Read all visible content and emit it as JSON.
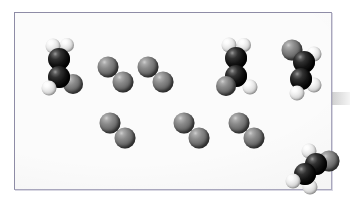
{
  "figure": {
    "panel": {
      "background_color": "#fbfbfb",
      "border_color": "#8e8ca6"
    },
    "edge_mark": {
      "name": "page-edge-smudge",
      "color": "#aaaaaa"
    }
  },
  "legend": {
    "atom_types": [
      {
        "key": "carbon",
        "label": "Carbon",
        "color": "#111111",
        "radius": 11
      },
      {
        "key": "halogen",
        "label": "Halogen",
        "color": "#7a7a7a",
        "radius": 10
      },
      {
        "key": "hydrogen",
        "label": "Hydrogen",
        "color": "#f2f2f2",
        "radius": 7.5
      }
    ]
  },
  "molecules": [
    {
      "name": "alkene-left",
      "formula": "C2H3X",
      "label": "substituted ethene",
      "x": 46,
      "y": 55,
      "atoms": [
        {
          "element": "hydrogen",
          "dx": -8,
          "dy": -22,
          "r": 7.5,
          "z": 3
        },
        {
          "element": "hydrogen",
          "dx": 6,
          "dy": -23,
          "r": 7.0,
          "z": 2
        },
        {
          "element": "carbon",
          "dx": -2,
          "dy": -9,
          "r": 11,
          "z": 5
        },
        {
          "element": "carbon",
          "dx": -2,
          "dy": 9,
          "r": 11,
          "z": 6
        },
        {
          "element": "halogen",
          "dx": 12,
          "dy": 16,
          "r": 10,
          "z": 4
        },
        {
          "element": "hydrogen",
          "dx": -12,
          "dy": 20,
          "r": 7.5,
          "z": 7
        }
      ]
    },
    {
      "name": "diatomic-top-1",
      "formula": "X2",
      "label": "diatomic molecule",
      "x": 101,
      "y": 62,
      "atoms": [
        {
          "element": "halogen",
          "dx": -8,
          "dy": -8,
          "r": 10.5,
          "z": 2
        },
        {
          "element": "halogen",
          "dx": 7,
          "dy": 7,
          "r": 10.5,
          "z": 1
        }
      ]
    },
    {
      "name": "diatomic-top-2",
      "formula": "X2",
      "label": "diatomic molecule",
      "x": 141,
      "y": 62,
      "atoms": [
        {
          "element": "halogen",
          "dx": -8,
          "dy": -8,
          "r": 10.5,
          "z": 2
        },
        {
          "element": "halogen",
          "dx": 7,
          "dy": 7,
          "r": 10.5,
          "z": 1
        }
      ]
    },
    {
      "name": "alkene-center-right",
      "formula": "C2H3X",
      "label": "substituted ethene",
      "x": 222,
      "y": 55,
      "atoms": [
        {
          "element": "hydrogen",
          "dx": -8,
          "dy": -23,
          "r": 7.5,
          "z": 3
        },
        {
          "element": "hydrogen",
          "dx": 7,
          "dy": -23,
          "r": 7.0,
          "z": 2
        },
        {
          "element": "carbon",
          "dx": -1,
          "dy": -10,
          "r": 11,
          "z": 5
        },
        {
          "element": "carbon",
          "dx": -1,
          "dy": 8,
          "r": 11,
          "z": 6
        },
        {
          "element": "halogen",
          "dx": -11,
          "dy": 18,
          "r": 10,
          "z": 7
        },
        {
          "element": "hydrogen",
          "dx": 13,
          "dy": 19,
          "r": 7.5,
          "z": 4
        }
      ]
    },
    {
      "name": "alkene-right",
      "formula": "C2H3X",
      "label": "substituted ethene",
      "x": 288,
      "y": 56,
      "atoms": [
        {
          "element": "halogen",
          "dx": -11,
          "dy": -19,
          "r": 10.5,
          "z": 4
        },
        {
          "element": "hydrogen",
          "dx": 11,
          "dy": -15,
          "r": 7.5,
          "z": 3
        },
        {
          "element": "carbon",
          "dx": 1,
          "dy": -7,
          "r": 11,
          "z": 5
        },
        {
          "element": "carbon",
          "dx": -2,
          "dy": 10,
          "r": 11,
          "z": 6
        },
        {
          "element": "hydrogen",
          "dx": 11,
          "dy": 16,
          "r": 7.5,
          "z": 4
        },
        {
          "element": "hydrogen",
          "dx": -6,
          "dy": 24,
          "r": 7.5,
          "z": 7
        }
      ]
    },
    {
      "name": "diatomic-bottom-1",
      "formula": "X2",
      "label": "diatomic molecule",
      "x": 103,
      "y": 118,
      "atoms": [
        {
          "element": "halogen",
          "dx": -8,
          "dy": -8,
          "r": 10.5,
          "z": 2
        },
        {
          "element": "halogen",
          "dx": 7,
          "dy": 7,
          "r": 10.5,
          "z": 1
        }
      ]
    },
    {
      "name": "diatomic-bottom-2",
      "formula": "X2",
      "label": "diatomic molecule",
      "x": 177,
      "y": 118,
      "atoms": [
        {
          "element": "halogen",
          "dx": -8,
          "dy": -8,
          "r": 10.5,
          "z": 2
        },
        {
          "element": "halogen",
          "dx": 7,
          "dy": 7,
          "r": 10.5,
          "z": 1
        }
      ]
    },
    {
      "name": "diatomic-bottom-3",
      "formula": "X2",
      "label": "diatomic molecule",
      "x": 232,
      "y": 118,
      "atoms": [
        {
          "element": "halogen",
          "dx": -8,
          "dy": -8,
          "r": 10.5,
          "z": 2
        },
        {
          "element": "halogen",
          "dx": 7,
          "dy": 7,
          "r": 10.5,
          "z": 1
        }
      ]
    },
    {
      "name": "alkene-bottom-right",
      "formula": "C2H3X",
      "label": "substituted ethene",
      "x": 298,
      "y": 158,
      "atoms": [
        {
          "element": "hydrogen",
          "dx": -4,
          "dy": -20,
          "r": 7.5,
          "z": 3
        },
        {
          "element": "halogen",
          "dx": 16,
          "dy": -10,
          "r": 10.5,
          "z": 2
        },
        {
          "element": "carbon",
          "dx": 3,
          "dy": -7,
          "r": 11,
          "z": 5
        },
        {
          "element": "carbon",
          "dx": -8,
          "dy": 3,
          "r": 11,
          "z": 6
        },
        {
          "element": "hydrogen",
          "dx": -20,
          "dy": 10,
          "r": 7.5,
          "z": 7
        },
        {
          "element": "hydrogen",
          "dx": -3,
          "dy": 16,
          "r": 7.5,
          "z": 4
        }
      ]
    }
  ]
}
